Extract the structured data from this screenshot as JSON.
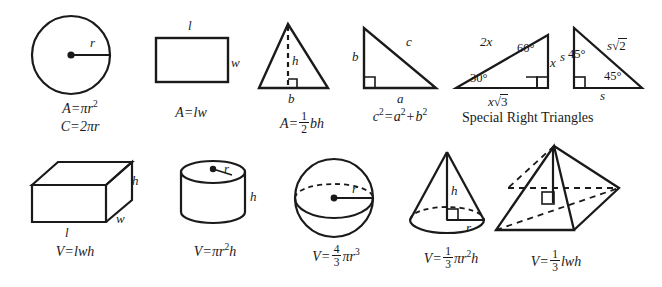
{
  "sheet": {
    "title": "Geometry Formula Reference Sheet",
    "ink_color": "#1a1a1a",
    "background_color": "#ffffff",
    "caption_special": "Special Right Triangles"
  },
  "row1": {
    "circle": {
      "name": "circle",
      "labels": {
        "radius": "r"
      },
      "formulas": {
        "area_lhs": "A",
        "area_eq": "=",
        "area_rhs_pi": "πr",
        "area_rhs_exp": "2",
        "circ_lhs": "C",
        "circ_eq": "=",
        "circ_rhs": "2πr"
      }
    },
    "rectangle": {
      "name": "rectangle",
      "labels": {
        "length": "l",
        "width": "w"
      },
      "formulas": {
        "lhs": "A",
        "eq": "=",
        "rhs": "lw"
      }
    },
    "triangle": {
      "name": "triangle",
      "labels": {
        "height": "h",
        "base": "b"
      },
      "formulas": {
        "lhs": "A",
        "eq": "=",
        "frac_num": "1",
        "frac_den": "2",
        "rhs": "bh"
      }
    },
    "right_triangle": {
      "name": "right-triangle",
      "labels": {
        "leg_b": "b",
        "hyp_c": "c",
        "leg_a": "a"
      },
      "formulas": {
        "c": "c",
        "c_exp": "2",
        "eq": "=",
        "a": "a",
        "a_exp": "2",
        "plus": "+",
        "b": "b",
        "b_exp": "2"
      }
    },
    "triangle_30_60_90": {
      "name": "30-60-90-triangle",
      "labels": {
        "hyp": "2x",
        "angle_60": "60°",
        "side_x": "x",
        "angle_30": "30°",
        "base_root3_x": "x",
        "base_root3_radical": "√",
        "base_root3_val": "3"
      }
    },
    "triangle_45_45_90": {
      "name": "45-45-90-triangle",
      "labels": {
        "leg_s_left": "s",
        "angle_45_top": "45°",
        "hyp_s": "s",
        "hyp_radical": "√",
        "hyp_val": "2",
        "angle_45_bottom": "45°",
        "base_s": "s"
      }
    }
  },
  "row2": {
    "rect_prism": {
      "name": "rectangular-prism",
      "labels": {
        "height": "h",
        "width": "w",
        "length": "l"
      },
      "formulas": {
        "lhs": "V",
        "eq": "=",
        "rhs": "lwh"
      }
    },
    "cylinder": {
      "name": "cylinder",
      "labels": {
        "radius": "r",
        "height": "h"
      },
      "formulas": {
        "lhs": "V",
        "eq": "=",
        "rhs_pi": "πr",
        "rhs_exp": "2",
        "rhs_h": "h"
      }
    },
    "sphere": {
      "name": "sphere",
      "labels": {
        "radius": "r"
      },
      "formulas": {
        "lhs": "V",
        "eq": "=",
        "frac_num": "4",
        "frac_den": "3",
        "rhs_pi": "πr",
        "rhs_exp": "3"
      }
    },
    "cone": {
      "name": "cone",
      "labels": {
        "height": "h",
        "radius": "r"
      },
      "formulas": {
        "lhs": "V",
        "eq": "=",
        "frac_num": "1",
        "frac_den": "3",
        "rhs_pi": "πr",
        "rhs_exp": "2",
        "rhs_h": "h"
      }
    },
    "pyramid": {
      "name": "pyramid",
      "labels": {},
      "formulas": {
        "lhs": "V",
        "eq": "=",
        "frac_num": "1",
        "frac_den": "3",
        "rhs": "lwh"
      }
    }
  }
}
